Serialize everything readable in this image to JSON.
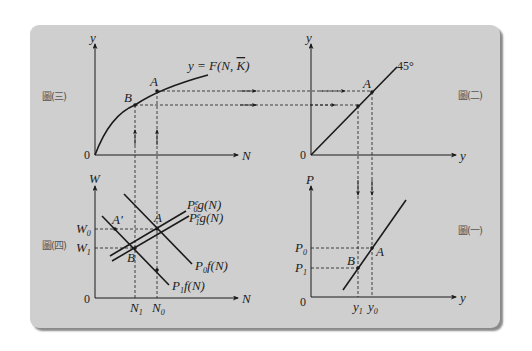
{
  "panels": {
    "top_left": {
      "figure_label": "圖(三)",
      "y_axis": "y",
      "x_axis": "N",
      "origin": "0",
      "curve_label": "y = F(N, K̄)",
      "points": [
        "A",
        "B"
      ]
    },
    "top_right": {
      "figure_label": "圖(二)",
      "y_axis": "y",
      "x_axis": "y",
      "origin": "0",
      "line_label": "45°",
      "points": [
        "A"
      ]
    },
    "bottom_left": {
      "figure_label": "圖(四)",
      "y_axis": "W",
      "x_axis": "N",
      "origin": "0",
      "y_ticks": [
        "W0",
        "W1"
      ],
      "x_ticks": [
        "N1",
        "N0"
      ],
      "lines": [
        "P0e g(N)",
        "P1e g(N)",
        "P0 f(N)",
        "P1 f(N)"
      ],
      "points": [
        "A'",
        "A",
        "B"
      ]
    },
    "bottom_right": {
      "figure_label": "圖(一)",
      "y_axis": "P",
      "x_axis": "y",
      "origin": "0",
      "y_ticks": [
        "P0",
        "P1"
      ],
      "x_ticks": [
        "y1",
        "y0"
      ],
      "points": [
        "A",
        "B"
      ]
    }
  },
  "colors": {
    "panel_bg": "#cfcfcf",
    "line": "#1a1a1a",
    "label": "#555555"
  }
}
